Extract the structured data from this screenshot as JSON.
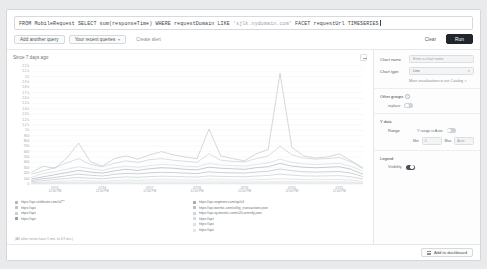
{
  "query": {
    "text_before": "FROM MobileRequest SELECT sum(responseTime) WHERE requestDomain LIKE ",
    "text_string": "'sjlk.nydomain.com'",
    "text_after": " FACET requestUrl TIMESERIES"
  },
  "toolbar": {
    "add_query": "Add another query",
    "recent_queries": "Your recent queries",
    "recent_chevron": "▾",
    "create_alert": "Create alert",
    "clear": "Clear",
    "run": "Run"
  },
  "chart_header": {
    "since": "Since 7 days ago",
    "expand_icon": "expand-icon"
  },
  "chart_data": {
    "type": "line",
    "title": "Since 7 days ago",
    "xlabel": "",
    "ylabel": "",
    "ylim": [
      0,
      2200
    ],
    "grid": true,
    "legend_position": "bottom",
    "ytick_labels": [
      "2.2 k",
      "2.1 k",
      "2 k",
      "1.9 k",
      "1.8 k",
      "1.7 k",
      "1.6 k",
      "1.5 k",
      "1.4 k",
      "1.3 k",
      "1.2 k",
      "1.1 k",
      "1 k",
      "900",
      "800",
      "700",
      "600",
      "500",
      "400",
      "300",
      "200",
      "100",
      "0"
    ],
    "ytick_values": [
      2200,
      2100,
      2000,
      1900,
      1800,
      1700,
      1600,
      1500,
      1400,
      1300,
      1200,
      1100,
      1000,
      900,
      800,
      700,
      600,
      500,
      400,
      300,
      200,
      100,
      0
    ],
    "xtick_labels": [
      "07/15\n12:00 PM",
      "07/16\n12:00 PM",
      "07/17\n12:00 PM",
      "07/18\n12:00 PM",
      "07/19\n12:00 PM",
      "07/20\n12:00 PM",
      "07/21\n12:00 PM"
    ],
    "x": [
      0,
      1,
      2,
      3,
      4,
      5,
      6,
      7,
      8,
      9,
      10,
      11,
      12,
      13,
      14,
      15,
      16,
      17,
      18,
      19,
      20,
      21,
      22,
      23,
      24,
      25,
      26,
      27,
      28
    ],
    "series": [
      {
        "name": "https://api.celebrate.com/v2**",
        "color": "#b0b6bb",
        "values": [
          210,
          330,
          290,
          480,
          760,
          410,
          330,
          470,
          520,
          460,
          540,
          600,
          540,
          500,
          470,
          1020,
          520,
          470,
          430,
          560,
          640,
          2060,
          680,
          520,
          480,
          500,
          560,
          430,
          300
        ]
      },
      {
        "name": "https://api/",
        "color": "#bcc2c7",
        "values": [
          180,
          240,
          300,
          390,
          470,
          360,
          320,
          380,
          430,
          400,
          450,
          470,
          440,
          420,
          400,
          560,
          440,
          420,
          410,
          470,
          520,
          700,
          540,
          480,
          460,
          470,
          490,
          410,
          280
        ]
      },
      {
        "name": "https://api/",
        "color": "#c8ced3",
        "values": [
          120,
          190,
          230,
          270,
          320,
          280,
          250,
          300,
          330,
          310,
          340,
          360,
          350,
          330,
          320,
          380,
          350,
          340,
          330,
          360,
          390,
          460,
          400,
          370,
          360,
          370,
          380,
          330,
          230
        ]
      },
      {
        "name": "https://api/",
        "color": "#9aa0a6",
        "values": [
          90,
          130,
          170,
          210,
          250,
          220,
          200,
          240,
          270,
          250,
          280,
          300,
          290,
          270,
          260,
          310,
          290,
          280,
          270,
          300,
          320,
          380,
          330,
          310,
          300,
          310,
          320,
          270,
          180
        ]
      },
      {
        "name": "https://api.segment.com/api/v1",
        "color": "#a6acb2",
        "values": [
          60,
          95,
          120,
          150,
          180,
          160,
          145,
          175,
          195,
          185,
          205,
          215,
          210,
          200,
          190,
          225,
          210,
          205,
          200,
          220,
          235,
          275,
          245,
          225,
          220,
          225,
          230,
          200,
          135
        ]
      },
      {
        "name": "https://api.twentic.com/utility_transactions.json",
        "color": "#b8bec3",
        "values": [
          40,
          60,
          80,
          100,
          120,
          105,
          95,
          115,
          130,
          122,
          135,
          142,
          138,
          132,
          126,
          148,
          138,
          135,
          132,
          145,
          155,
          180,
          162,
          148,
          145,
          148,
          152,
          132,
          90
        ]
      },
      {
        "name": "https://api.ay.twentic.com/v2/currently.json",
        "color": "#ced4d9",
        "values": [
          20,
          32,
          42,
          52,
          62,
          55,
          50,
          60,
          68,
          64,
          70,
          74,
          72,
          69,
          66,
          77,
          72,
          70,
          69,
          76,
          81,
          94,
          85,
          77,
          76,
          77,
          79,
          69,
          47
        ]
      },
      {
        "name": "https://api/",
        "color": "#d4dade",
        "values": [
          10,
          16,
          21,
          26,
          31,
          27,
          25,
          30,
          34,
          32,
          35,
          37,
          36,
          34,
          33,
          38,
          36,
          35,
          34,
          38,
          40,
          47,
          42,
          38,
          38,
          38,
          39,
          34,
          23
        ]
      },
      {
        "name": "https://api/",
        "color": "#dde2e6",
        "values": [
          5,
          8,
          11,
          13,
          16,
          14,
          12,
          15,
          17,
          16,
          18,
          19,
          18,
          17,
          16,
          19,
          18,
          18,
          17,
          19,
          20,
          24,
          21,
          19,
          19,
          19,
          20,
          17,
          12
        ]
      },
      {
        "name": "https://api/",
        "color": "#e3e7ea",
        "values": [
          2,
          4,
          5,
          7,
          8,
          7,
          6,
          8,
          9,
          8,
          9,
          10,
          9,
          9,
          8,
          10,
          9,
          9,
          9,
          10,
          10,
          12,
          11,
          10,
          10,
          10,
          10,
          9,
          6
        ]
      }
    ]
  },
  "legend": {
    "column_left": [
      {
        "label": "https://api.celebrate.com/v2**",
        "color": "#b0b6bb"
      },
      {
        "label": "https://api/",
        "color": "#bcc2c7"
      },
      {
        "label": "https://api/",
        "color": "#c8ced3"
      },
      {
        "label": "https://api/",
        "color": "#9aa0a6"
      }
    ],
    "column_mid": [
      {
        "label": "https://api.segment.com/api/v1",
        "color": "#a6acb2"
      },
      {
        "label": "https://api.twentic.com/utility_transactions.json",
        "color": "#b8bec3"
      },
      {
        "label": "https://api.ay.twentic.com/v2/currently.json",
        "color": "#ced4d9"
      }
    ],
    "column_right": [
      {
        "label": "https://api/",
        "color": "#d4dade"
      },
      {
        "label": "https://api/",
        "color": "#dde2e6"
      },
      {
        "label": "https://api/",
        "color": "#e3e7ea"
      }
    ],
    "note": "(All other series have 1 min. to 4.9 sec.)"
  },
  "panel": {
    "chart_name_label": "Chart name",
    "chart_name_placeholder": "Enter a chart name",
    "chart_name_value": "",
    "chart_type_label": "Chart type",
    "chart_type_value": "Line",
    "chart_type_chevron": "▾",
    "catalog_link": "More visualizations in our Catalog",
    "catalog_ext_icon": "↗",
    "other_groups_title": "Other groups",
    "other_groups_info_icon": "info-icon",
    "replace_label": "replace",
    "replace_on": false,
    "y_data_title": "Y data",
    "range_label": "Range",
    "y_range_auto_label": "Y range is Auto",
    "y_range_auto_on": false,
    "min_label": "Min",
    "min_value": "0",
    "max_label": "Max",
    "max_value": "Auto",
    "legend_title": "Legend",
    "visibility_label": "Visibility",
    "visibility_on": true
  },
  "footer": {
    "add_to_dashboard": "Add to dashboard",
    "grid_icon": "grid-icon"
  }
}
